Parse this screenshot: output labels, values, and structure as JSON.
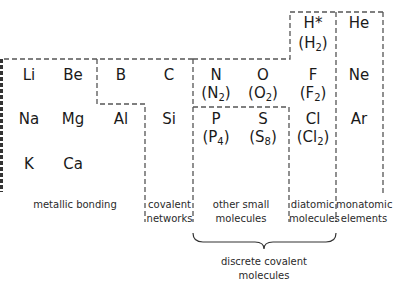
{
  "elements": {
    "H": "H*",
    "He": "He",
    "Li": "Li",
    "Be": "Be",
    "B": "B",
    "C": "C",
    "N": "N",
    "O": "O",
    "F": "F",
    "Ne": "Ne",
    "Na": "Na",
    "Mg": "Mg",
    "Al": "Al",
    "Si": "Si",
    "P": "P",
    "S": "S",
    "Cl": "Cl",
    "Ar": "Ar",
    "K": "K",
    "Ca": "Ca"
  },
  "molecules": {
    "H2": {
      "base": "(H",
      "sub": "2",
      "close": ")"
    },
    "N2": {
      "base": "(N",
      "sub": "2",
      "close": ")"
    },
    "O2": {
      "base": "(O",
      "sub": "2",
      "close": ")"
    },
    "F2": {
      "base": "(F",
      "sub": "2",
      "close": ")"
    },
    "P4": {
      "base": "(P",
      "sub": "4",
      "close": ")"
    },
    "S8": {
      "base": "(S",
      "sub": "8",
      "close": ")"
    },
    "Cl2": {
      "base": "(Cl",
      "sub": "2",
      "close": ")"
    }
  },
  "labels": {
    "metallic": "metallic bonding",
    "covalent_1": "covalent",
    "covalent_2": "networks",
    "other_1": "other small",
    "other_2": "molecules",
    "diatomic_1": "diatomic",
    "diatomic_2": "molecules",
    "monatomic_1": "monatomic",
    "monatomic_2": "elements",
    "discrete_1": "discrete covalent",
    "discrete_2": "molecules"
  },
  "colors": {
    "line": "#555555",
    "text": "#1a1a1a"
  }
}
